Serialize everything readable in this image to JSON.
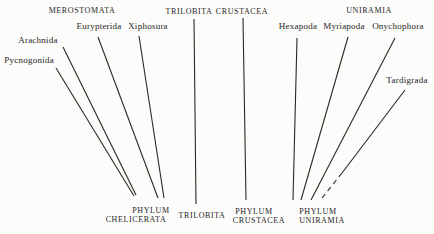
{
  "style": {
    "background": "#fcfcfa",
    "line_color": "#2a2824",
    "text_color": "#26241f"
  },
  "headers": {
    "merostomata": "MEROSTOMATA",
    "trilobita": "TRILOBITA",
    "crustacea": "CRUSTACEA",
    "uniramia": "UNIRAMIA"
  },
  "taxa": {
    "pycnogonida": "Pycnogonida",
    "arachnida": "Arachnida",
    "eurypterida": "Eurypterida",
    "xiphosura": "Xiphosura",
    "hexapoda": "Hexapoda",
    "myriapoda": "Myriapoda",
    "onychophora": "Onychophora",
    "tardigrada": "Tardigrada"
  },
  "phyla": {
    "chelicerata_line1": "PHYLUM",
    "chelicerata_line2": "CHELICERATA",
    "trilobita": "TRILOBITA",
    "crustacea_line1": "PHYLUM",
    "crustacea_line2": "CRUSTACEA",
    "uniramia_line1": "PHYLUM",
    "uniramia_line2": "UNIRAMIA"
  },
  "lines": [
    {
      "name": "pycnogonida-line",
      "x1": 56,
      "y1": 68,
      "x2": 134,
      "y2": 196,
      "dashed": false
    },
    {
      "name": "arachnida-line",
      "x1": 63,
      "y1": 47,
      "x2": 136,
      "y2": 195,
      "dashed": false
    },
    {
      "name": "eurypterida-line",
      "x1": 98,
      "y1": 37,
      "x2": 158,
      "y2": 198,
      "dashed": false
    },
    {
      "name": "xiphosura-line",
      "x1": 139,
      "y1": 36,
      "x2": 164,
      "y2": 198,
      "dashed": false
    },
    {
      "name": "trilobita-line",
      "x1": 194,
      "y1": 19,
      "x2": 196,
      "y2": 204,
      "dashed": false
    },
    {
      "name": "crustacea-line",
      "x1": 243,
      "y1": 18,
      "x2": 246,
      "y2": 200,
      "dashed": false
    },
    {
      "name": "hexapoda-line",
      "x1": 297,
      "y1": 38,
      "x2": 293,
      "y2": 200,
      "dashed": false
    },
    {
      "name": "myriapoda-line",
      "x1": 348,
      "y1": 37,
      "x2": 301,
      "y2": 200,
      "dashed": false
    },
    {
      "name": "onychophora-line",
      "x1": 395,
      "y1": 38,
      "x2": 311,
      "y2": 200,
      "dashed": false
    },
    {
      "name": "tardigrada-line-solid",
      "x1": 405,
      "y1": 90,
      "x2": 342,
      "y2": 173,
      "dashed": false
    },
    {
      "name": "tardigrada-line-dashed",
      "x1": 342,
      "y1": 173,
      "x2": 322,
      "y2": 198,
      "dashed": true
    }
  ]
}
